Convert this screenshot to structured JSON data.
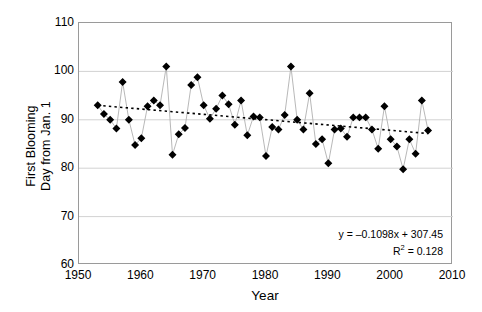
{
  "chart_data": {
    "type": "scatter",
    "title": "",
    "xlabel": "Year",
    "ylabel": "First Blooming Day from Jan. 1",
    "ylabel_lines": [
      "First Blooming",
      "Day from Jan. 1"
    ],
    "xlim": [
      1950,
      2010
    ],
    "ylim": [
      60,
      110
    ],
    "xticks": [
      1950,
      1960,
      1970,
      1980,
      1990,
      2000,
      2010
    ],
    "yticks": [
      60,
      70,
      80,
      90,
      100,
      110
    ],
    "grid": "horizontal",
    "legend": "none",
    "marker": "filled-diamond",
    "marker_color": "#000000",
    "line_color": "#b0b0b0",
    "trendline_style": "dotted",
    "trendline_color": "#000000",
    "annotations": {
      "equation": "y = –0.1098x + 307.45",
      "r_squared_prefix": "R",
      "r_squared_sup": "2",
      "r_squared_value": " = 0.128"
    },
    "x": [
      1953,
      1954,
      1955,
      1956,
      1957,
      1958,
      1959,
      1960,
      1961,
      1962,
      1963,
      1964,
      1965,
      1966,
      1967,
      1968,
      1969,
      1970,
      1971,
      1972,
      1973,
      1974,
      1975,
      1976,
      1977,
      1978,
      1979,
      1980,
      1981,
      1982,
      1983,
      1984,
      1985,
      1986,
      1987,
      1988,
      1989,
      1990,
      1991,
      1992,
      1993,
      1994,
      1995,
      1996,
      1997,
      1998,
      1999,
      2000,
      2001,
      2002,
      2003,
      2004,
      2005,
      2006
    ],
    "y": [
      93.0,
      91.2,
      90.0,
      88.2,
      97.8,
      90.0,
      84.8,
      86.2,
      92.8,
      94.0,
      93.0,
      101.0,
      82.8,
      87.0,
      88.3,
      97.2,
      98.8,
      93.0,
      90.2,
      92.3,
      95.0,
      93.2,
      89.0,
      94.0,
      86.8,
      90.7,
      90.5,
      82.5,
      88.5,
      88.0,
      91.0,
      101.0,
      90.0,
      88.0,
      95.5,
      85.0,
      86.0,
      81.0,
      88.0,
      88.2,
      86.5,
      90.5,
      90.5,
      90.5,
      88.0,
      84.0,
      92.8,
      86.0,
      84.5,
      79.8,
      86.0,
      83.0,
      94.0,
      87.8
    ],
    "trendline": {
      "slope": -0.1098,
      "intercept": 307.45,
      "r_squared": 0.128,
      "x_start": 1953,
      "x_end": 2006,
      "y_start": 92.99,
      "y_end": 87.17
    }
  }
}
